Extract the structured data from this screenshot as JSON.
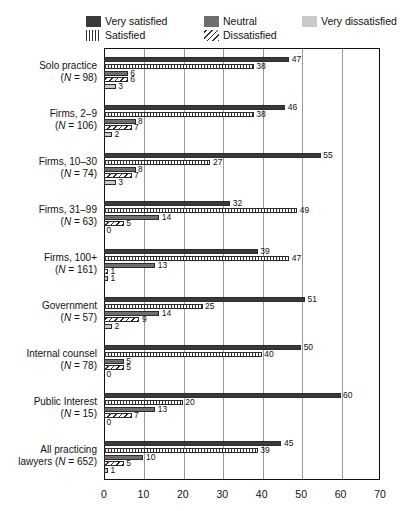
{
  "title_sliver": "",
  "legend": {
    "items": [
      {
        "label": "Very satisfied",
        "key": "very_satisfied",
        "fill": "f-verysat",
        "color": "#3a3a3a",
        "col": "c1",
        "row": 1
      },
      {
        "label": "Neutral",
        "key": "neutral",
        "fill": "f-neutral",
        "color": "#6e6e6e",
        "col": "c2",
        "row": 1
      },
      {
        "label": "Very dissatisfied",
        "key": "very_dissatisfied",
        "fill": "f-verydis",
        "color": "#c9c9c9",
        "col": "c3",
        "row": 1
      },
      {
        "label": "Satisfied",
        "key": "satisfied",
        "fill": "f-sat",
        "color": "#2f2f2f",
        "col": "c1",
        "row": 2
      },
      {
        "label": "Dissatisfied",
        "key": "dissatisfied",
        "fill": "f-dis",
        "color": "#2f2f2f",
        "col": "c2",
        "row": 2
      }
    ]
  },
  "chart_data": {
    "type": "bar",
    "orientation": "horizontal",
    "title": "",
    "xlabel": "",
    "ylabel": "",
    "xlim": [
      0,
      70
    ],
    "xticks": [
      0,
      10,
      20,
      30,
      40,
      50,
      60,
      70
    ],
    "grid": true,
    "legend_position": "top",
    "categories": [
      {
        "name": "Solo practice",
        "n": 98,
        "lines": [
          "Solo practice",
          "(N = 98)"
        ]
      },
      {
        "name": "Firms, 2–9",
        "n": 106,
        "lines": [
          "Firms, 2–9",
          "(N = 106)"
        ]
      },
      {
        "name": "Firms, 10–30",
        "n": 74,
        "lines": [
          "Firms, 10–30",
          "(N = 74)"
        ]
      },
      {
        "name": "Firms, 31–99",
        "n": 63,
        "lines": [
          "Firms, 31–99",
          "(N = 63)"
        ]
      },
      {
        "name": "Firms, 100+",
        "n": 161,
        "lines": [
          "Firms, 100+",
          "(N = 161)"
        ]
      },
      {
        "name": "Government",
        "n": 57,
        "lines": [
          "Government",
          "(N = 57)"
        ]
      },
      {
        "name": "Internal counsel",
        "n": 78,
        "lines": [
          "Internal counsel",
          "(N = 78)"
        ]
      },
      {
        "name": "Public Interest",
        "n": 15,
        "lines": [
          "Public Interest",
          "(N = 15)"
        ]
      },
      {
        "name": "All practicing lawyers",
        "n": 652,
        "lines": [
          "All practicing",
          "lawyers (N = 652)"
        ]
      }
    ],
    "series": [
      {
        "name": "Very satisfied",
        "fill": "f-verysat",
        "values": [
          47,
          46,
          55,
          32,
          39,
          51,
          50,
          60,
          45
        ]
      },
      {
        "name": "Satisfied",
        "fill": "f-sat",
        "values": [
          38,
          38,
          27,
          49,
          47,
          25,
          40,
          20,
          39
        ]
      },
      {
        "name": "Neutral",
        "fill": "f-neutral",
        "values": [
          6,
          8,
          8,
          14,
          13,
          14,
          5,
          13,
          10
        ]
      },
      {
        "name": "Dissatisfied",
        "fill": "f-dis",
        "values": [
          6,
          7,
          7,
          5,
          1,
          9,
          5,
          7,
          5
        ]
      },
      {
        "name": "Very dissatisfied",
        "fill": "f-verydis",
        "values": [
          3,
          2,
          3,
          0,
          1,
          2,
          0,
          0,
          1
        ]
      }
    ]
  }
}
